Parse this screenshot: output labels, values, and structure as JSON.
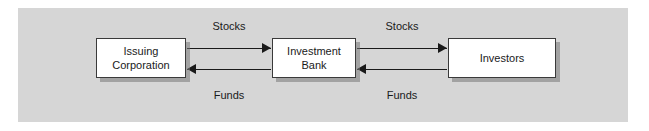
{
  "diagram": {
    "type": "flow",
    "background_color": "#ffffff",
    "panel_color": "#d6d6d6",
    "node_fill_color": "#ffffff",
    "node_border_color": "#3a3a3a",
    "arrow_color": "#1a1a1a",
    "nodes": [
      {
        "id": "issuing-corporation",
        "line1": "Issuing",
        "line2": "Corporation"
      },
      {
        "id": "investment-bank",
        "line1": "Investment",
        "line2": "Bank"
      },
      {
        "id": "investors",
        "line1": "Investors",
        "line2": ""
      }
    ],
    "edges": [
      {
        "id": "stocks-left",
        "label": "Stocks",
        "from": "issuing-corporation",
        "to": "investment-bank",
        "direction": "right"
      },
      {
        "id": "funds-left",
        "label": "Funds",
        "from": "investment-bank",
        "to": "issuing-corporation",
        "direction": "left"
      },
      {
        "id": "stocks-right",
        "label": "Stocks",
        "from": "investment-bank",
        "to": "investors",
        "direction": "right"
      },
      {
        "id": "funds-right",
        "label": "Funds",
        "from": "investors",
        "to": "investment-bank",
        "direction": "left"
      }
    ]
  }
}
